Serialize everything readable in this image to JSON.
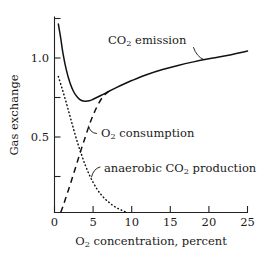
{
  "chart_data": {
    "type": "line",
    "title": "",
    "xlabel": "O₂ concentration,  percent",
    "ylabel": "Gas exchange",
    "xlim": [
      0,
      25
    ],
    "ylim": [
      0,
      1.35
    ],
    "grid": false,
    "legend_position": "inline-annotations",
    "xticks": [
      0,
      5,
      10,
      15,
      20,
      25
    ],
    "xtick_labels": [
      "0",
      "5",
      "10",
      "15",
      "20",
      "25"
    ],
    "yticks": [
      0.25,
      0.5,
      0.75,
      1.0,
      1.25
    ],
    "ytick_labels": [
      "",
      "0.5",
      "",
      "1.0",
      ""
    ],
    "ylabeled_ticks": [
      "0.5",
      "1.0"
    ],
    "series": [
      {
        "name": "CO₂ emission",
        "label_main": "CO",
        "label_sub": "2",
        "label_rest": " emission",
        "style": "solid",
        "x": [
          0.5,
          0.8,
          1.1,
          1.5,
          2.0,
          2.5,
          3.0,
          3.5,
          4.0,
          4.5,
          5.0,
          6.0,
          7.0,
          8.0,
          9.0,
          10.0,
          12.0,
          14.0,
          16.0,
          18.0,
          20.0,
          22.0,
          25.0
        ],
        "values": [
          1.22,
          1.13,
          1.03,
          0.93,
          0.84,
          0.78,
          0.745,
          0.725,
          0.72,
          0.723,
          0.733,
          0.757,
          0.783,
          0.808,
          0.832,
          0.854,
          0.893,
          0.925,
          0.952,
          0.975,
          0.995,
          1.013,
          1.045
        ]
      },
      {
        "name": "O₂ consumption",
        "label_main": "O",
        "label_sub": "2",
        "label_rest": " consumption",
        "style": "dashed",
        "x": [
          0.8,
          1.2,
          1.6,
          2.0,
          2.5,
          3.0,
          3.5,
          4.0,
          4.5,
          5.0,
          5.5,
          6.0,
          6.5,
          7.0
        ],
        "values": [
          0.0,
          0.055,
          0.115,
          0.175,
          0.255,
          0.335,
          0.415,
          0.49,
          0.565,
          0.63,
          0.685,
          0.73,
          0.762,
          0.783
        ]
      },
      {
        "name": "anaerobic CO₂ production",
        "label_main": "anaerobic CO",
        "label_sub": "2",
        "label_rest": " production",
        "style": "dotted",
        "x": [
          0.5,
          1.0,
          1.5,
          2.0,
          2.5,
          3.0,
          3.5,
          4.0,
          4.5,
          5.0,
          5.5,
          6.0,
          6.5,
          7.0,
          7.5,
          8.0,
          8.5,
          9.0,
          9.5
        ],
        "values": [
          0.88,
          0.8,
          0.715,
          0.625,
          0.535,
          0.45,
          0.375,
          0.305,
          0.245,
          0.195,
          0.152,
          0.118,
          0.09,
          0.068,
          0.048,
          0.032,
          0.019,
          0.008,
          0.0
        ]
      }
    ],
    "annotations": [
      {
        "text": "CO₂ emission",
        "x": 12.0,
        "y": 1.14
      },
      {
        "text": "O₂ consumption",
        "x": 6.4,
        "y": 0.545
      },
      {
        "text": "anaerobic CO₂ production",
        "x": 7.1,
        "y": 0.295
      }
    ]
  },
  "axis": {
    "y_title": "Gas exchange",
    "x_title_main": "O",
    "x_title_sub": "2",
    "x_title_rest": " concentration,  percent",
    "xtick_0": "0",
    "xtick_5": "5",
    "xtick_10": "10",
    "xtick_15": "15",
    "xtick_20": "20",
    "xtick_25": "25",
    "ytick_05": "0.5",
    "ytick_10": "1.0"
  },
  "labels": {
    "co2_emission_main": "CO",
    "co2_emission_sub": "2",
    "co2_emission_rest": " emission",
    "o2_consumption_main": "O",
    "o2_consumption_sub": "2",
    "o2_consumption_rest": " consumption",
    "anaerobic_main": "anaerobic CO",
    "anaerobic_sub": "2",
    "anaerobic_rest": " production"
  },
  "colors": {
    "background": "#ffffff",
    "ink": "#111111",
    "axis": "#222222"
  }
}
